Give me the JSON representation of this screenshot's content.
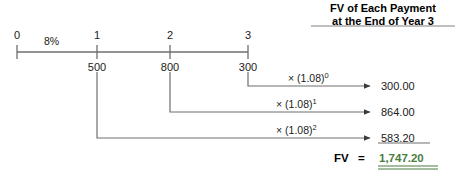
{
  "header": {
    "line1": "FV of Each Payment",
    "line2": "at the End of Year 3"
  },
  "timeline": {
    "rate_label": "8%",
    "periods": [
      {
        "label": "0",
        "cashflow": ""
      },
      {
        "label": "1",
        "cashflow": "500"
      },
      {
        "label": "2",
        "cashflow": "800"
      },
      {
        "label": "3",
        "cashflow": "300"
      }
    ]
  },
  "compounding": [
    {
      "factor_base": "× (1.08)",
      "factor_exponent": "0",
      "future_value": "300.00"
    },
    {
      "factor_base": "× (1.08)",
      "factor_exponent": "1",
      "future_value": "864.00"
    },
    {
      "factor_base": "× (1.08)",
      "factor_exponent": "2",
      "future_value": "583.20"
    }
  ],
  "total": {
    "label": "FV",
    "equals": "=",
    "value": "1,747.20"
  },
  "colors": {
    "line": "#6e6e6e",
    "text": "#1a1a1a",
    "total_green": "#4a7c3f",
    "header_rule": "#808080"
  }
}
